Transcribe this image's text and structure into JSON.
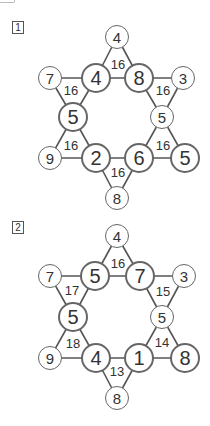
{
  "puzzles": [
    {
      "label": "1",
      "outer": [
        {
          "id": "top",
          "value": "4",
          "x": 117,
          "y": 37,
          "size": "small"
        },
        {
          "id": "upper-left",
          "value": "7",
          "x": 50,
          "y": 78,
          "size": "small"
        },
        {
          "id": "upper-right",
          "value": "3",
          "x": 183,
          "y": 78,
          "size": "small"
        },
        {
          "id": "lower-left",
          "value": "9",
          "x": 50,
          "y": 158,
          "size": "small"
        },
        {
          "id": "lower-right",
          "value": "5",
          "x": 185,
          "y": 158,
          "size": "big"
        },
        {
          "id": "bottom",
          "value": "8",
          "x": 117,
          "y": 198,
          "size": "small"
        }
      ],
      "inner": [
        {
          "id": "top-left",
          "value": "4",
          "x": 96,
          "y": 78,
          "size": "big"
        },
        {
          "id": "top-right",
          "value": "8",
          "x": 139,
          "y": 78,
          "size": "big"
        },
        {
          "id": "left",
          "value": "5",
          "x": 73,
          "y": 117,
          "size": "big"
        },
        {
          "id": "right",
          "value": "5",
          "x": 162,
          "y": 117,
          "size": "small"
        },
        {
          "id": "bottom-left",
          "value": "2",
          "x": 96,
          "y": 158,
          "size": "big"
        },
        {
          "id": "bottom-right",
          "value": "6",
          "x": 139,
          "y": 158,
          "size": "big"
        }
      ],
      "sums": [
        {
          "value": "16",
          "x": 118,
          "y": 64
        },
        {
          "value": "16",
          "x": 71,
          "y": 90
        },
        {
          "value": "16",
          "x": 163,
          "y": 90
        },
        {
          "value": "16",
          "x": 71,
          "y": 145
        },
        {
          "value": "16",
          "x": 163,
          "y": 145
        },
        {
          "value": "16",
          "x": 118,
          "y": 172
        }
      ]
    },
    {
      "label": "2",
      "outer": [
        {
          "id": "top",
          "value": "4",
          "x": 117,
          "y": 236,
          "size": "small"
        },
        {
          "id": "upper-left",
          "value": "7",
          "x": 50,
          "y": 276,
          "size": "small"
        },
        {
          "id": "upper-right",
          "value": "3",
          "x": 184,
          "y": 276,
          "size": "small"
        },
        {
          "id": "lower-left",
          "value": "9",
          "x": 50,
          "y": 358,
          "size": "small"
        },
        {
          "id": "lower-right",
          "value": "8",
          "x": 185,
          "y": 358,
          "size": "big"
        },
        {
          "id": "bottom",
          "value": "8",
          "x": 117,
          "y": 398,
          "size": "small"
        }
      ],
      "inner": [
        {
          "id": "top-left",
          "value": "5",
          "x": 95,
          "y": 276,
          "size": "big"
        },
        {
          "id": "top-right",
          "value": "7",
          "x": 140,
          "y": 276,
          "size": "big"
        },
        {
          "id": "left",
          "value": "5",
          "x": 73,
          "y": 317,
          "size": "big"
        },
        {
          "id": "right",
          "value": "5",
          "x": 162,
          "y": 317,
          "size": "small"
        },
        {
          "id": "bottom-left",
          "value": "4",
          "x": 96,
          "y": 358,
          "size": "big"
        },
        {
          "id": "bottom-right",
          "value": "1",
          "x": 139,
          "y": 358,
          "size": "big"
        }
      ],
      "sums": [
        {
          "value": "16",
          "x": 118,
          "y": 263
        },
        {
          "value": "17",
          "x": 72,
          "y": 290
        },
        {
          "value": "15",
          "x": 163,
          "y": 291
        },
        {
          "value": "18",
          "x": 73,
          "y": 343
        },
        {
          "value": "14",
          "x": 162,
          "y": 342
        },
        {
          "value": "13",
          "x": 117,
          "y": 371
        }
      ]
    }
  ]
}
